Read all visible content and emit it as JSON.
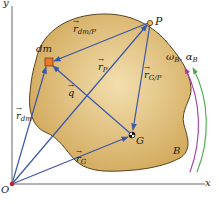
{
  "diagram": {
    "axes": {
      "x_label": "x",
      "y_label": "y",
      "origin_label": "O"
    },
    "body_label": "B",
    "points": {
      "P": {
        "label": "P"
      },
      "dm": {
        "label": "dm"
      },
      "G": {
        "label": "G"
      }
    },
    "vectors": [
      {
        "id": "r_dm_P",
        "symbol": "r",
        "sub": "dm/P"
      },
      {
        "id": "r_P",
        "symbol": "r",
        "sub": "P"
      },
      {
        "id": "r_G_P",
        "symbol": "r",
        "sub": "G/P"
      },
      {
        "id": "q",
        "symbol": "q",
        "sub": ""
      },
      {
        "id": "r_dm",
        "symbol": "r",
        "sub": "dm"
      },
      {
        "id": "r_G",
        "symbol": "r",
        "sub": "G"
      }
    ],
    "rotation": {
      "omega": "ω",
      "omega_sub": "B",
      "sep": ",",
      "alpha": "α",
      "alpha_sub": "B"
    },
    "colors": {
      "body_fill": "#d9b36a",
      "body_stroke": "#5a4320",
      "vector": "#3b57a8",
      "dm_square": "#e8782a",
      "origin_dot": "#c8202a",
      "omega_arrow": "#a23ca8",
      "alpha_arrow": "#4caa4a",
      "axis": "#555555"
    }
  }
}
